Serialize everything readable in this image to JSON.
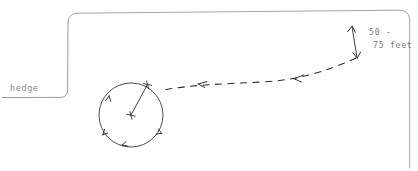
{
  "diagram": {
    "background_color": "#ffffff",
    "ink_color": "#2b2b2b",
    "light_ink_color": "#9a9a9a",
    "labels": {
      "hedge": "hedge",
      "distance_line_1": "50 -",
      "distance_line_2": "75 feet"
    },
    "elements": {
      "frame_name": "page-border",
      "hedge_name": "hedge-outline",
      "circle_name": "circling-path",
      "radius_name": "radius-line",
      "approach_name": "approach-path",
      "dimension_name": "distance-dimension-arrow"
    },
    "circle": {
      "center_x": 131,
      "center_y": 115,
      "radius": 32,
      "direction": "counterclockwise"
    },
    "dimension": {
      "from_x": 352,
      "from_y": 26,
      "to_x": 357,
      "to_y": 58,
      "value_min": 50,
      "value_max": 75,
      "unit": "feet"
    }
  }
}
